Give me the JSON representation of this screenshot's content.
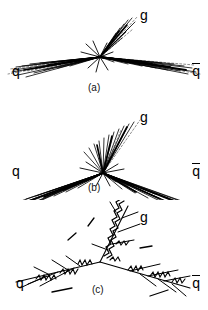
{
  "figure": {
    "background_color": "#ffffff",
    "ink_color": "#000000",
    "panels": [
      {
        "id": "a",
        "caption": "(a)",
        "labels": {
          "quark": "q",
          "antiquark": "q",
          "antiquark_bar": true,
          "gluon": "g"
        },
        "style": "track-bundle",
        "vertex": {
          "x": 100,
          "y": 57
        },
        "jets": [
          {
            "name": "quark-jet",
            "label": "q",
            "angle_deg": 186,
            "length": 92,
            "tracks": 15,
            "spread_deg": 7
          },
          {
            "name": "antiquark-jet",
            "label": "q",
            "angle_deg": 9,
            "length": 92,
            "tracks": 15,
            "spread_deg": 7
          },
          {
            "name": "gluon-jet",
            "label": "g",
            "angle_deg": 297,
            "length": 46,
            "tracks": 9,
            "spread_deg": 11
          }
        ]
      },
      {
        "id": "b",
        "caption": "(b)",
        "labels": {
          "quark": "q",
          "antiquark": "q",
          "antiquark_bar": true,
          "gluon": "g"
        },
        "style": "track-bundle",
        "vertex": {
          "x": 103,
          "y": 73
        },
        "jets": [
          {
            "name": "quark-jet",
            "label": "q",
            "angle_deg": 200,
            "length": 95,
            "tracks": 15,
            "spread_deg": 6
          },
          {
            "name": "antiquark-jet",
            "label": "q",
            "angle_deg": 337,
            "length": 95,
            "tracks": 15,
            "spread_deg": 6
          },
          {
            "name": "gluon-jet",
            "label": "g",
            "angle_deg": 290,
            "length": 48,
            "tracks": 11,
            "spread_deg": 16
          }
        ]
      },
      {
        "id": "c",
        "caption": "(c)",
        "labels": {
          "quark": "q",
          "antiquark": "q",
          "antiquark_bar": true,
          "gluon": "g"
        },
        "style": "parton-shower-with-gluon-coils",
        "vertex": {
          "x": 100,
          "y": 62
        },
        "jets": [
          {
            "name": "quark-jet",
            "label": "q",
            "angle_deg": 194,
            "length": 92,
            "coils": 3,
            "coil_turns": 6
          },
          {
            "name": "antiquark-jet",
            "label": "q",
            "angle_deg": 338,
            "length": 92,
            "coils": 3,
            "coil_turns": 6
          },
          {
            "name": "gluon-jet",
            "label": "g",
            "angle_deg": 283,
            "length": 62,
            "coils": 2,
            "coil_turns": 14
          }
        ]
      }
    ]
  }
}
